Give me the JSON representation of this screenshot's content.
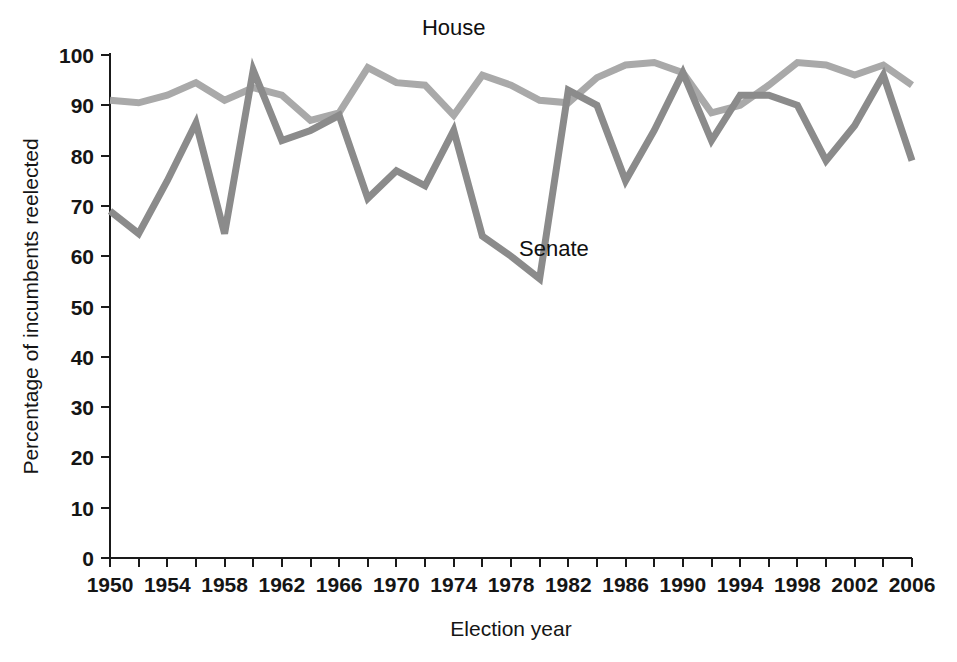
{
  "chart_data": {
    "type": "line",
    "title": "",
    "xlabel": "Election year",
    "ylabel": "Percentage of incumbents reelected",
    "xlim": [
      1950,
      2006
    ],
    "ylim": [
      0,
      100
    ],
    "grid": false,
    "legend_position": "inline-annotations",
    "x": [
      1950,
      1952,
      1954,
      1956,
      1958,
      1960,
      1962,
      1964,
      1966,
      1968,
      1970,
      1972,
      1974,
      1976,
      1978,
      1980,
      1982,
      1984,
      1986,
      1988,
      1990,
      1992,
      1994,
      1996,
      1998,
      2000,
      2002,
      2004,
      2006
    ],
    "xticks_major": [
      "1950",
      "1954",
      "1958",
      "1962",
      "1966",
      "1970",
      "1974",
      "1978",
      "1982",
      "1986",
      "1990",
      "1994",
      "1998",
      "2002",
      "2006"
    ],
    "yticks": [
      "0",
      "10",
      "20",
      "30",
      "40",
      "50",
      "60",
      "70",
      "80",
      "90",
      "100"
    ],
    "series": [
      {
        "name": "House",
        "color": "#a9a9a9",
        "label": "House",
        "label_x": 1974,
        "label_y": 104,
        "values": [
          91,
          90.5,
          92,
          94.5,
          91,
          93.5,
          92,
          87,
          88.5,
          97.5,
          94.5,
          94,
          88,
          96,
          94,
          91,
          90.5,
          95.5,
          98,
          98.5,
          96.5,
          88.5,
          90,
          94,
          98.5,
          98,
          96,
          98,
          94
        ]
      },
      {
        "name": "Senate",
        "color": "#8b8b8b",
        "label": "Senate",
        "label_x": 1981,
        "label_y": 60,
        "values": [
          69,
          64.5,
          75,
          86.5,
          64.5,
          97,
          83,
          85,
          88,
          71.5,
          77,
          74,
          85,
          64,
          60,
          55.5,
          93,
          90,
          75,
          85,
          96.5,
          83,
          92,
          92,
          90,
          79,
          86,
          96,
          79
        ]
      }
    ]
  },
  "axis": {
    "y_title": "Percentage of incumbents reelected",
    "x_title": "Election year"
  }
}
